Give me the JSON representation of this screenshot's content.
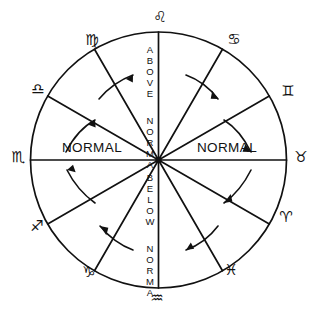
{
  "diagram": {
    "type": "radial-wheel",
    "sector_count": 12,
    "stroke_color": "#111111",
    "background_color": "#ffffff"
  },
  "axis_labels": {
    "top_vertical": "ABOVE NORMAL",
    "bottom_vertical": "BELOW NORMAL",
    "left_horizontal": "NORMAL",
    "right_horizontal": "NORMAL",
    "top_line1": "ABOVE",
    "top_line2": "NORMAL",
    "bottom_line1": "BELOW",
    "bottom_line2": "NORMAL"
  },
  "zodiac_signs": [
    {
      "name": "Leo",
      "glyph": "♌",
      "position": "top",
      "angle_deg": 90
    },
    {
      "name": "Cancer",
      "glyph": "♋",
      "position": "upper-right",
      "angle_deg": 60
    },
    {
      "name": "Gemini",
      "glyph": "♊",
      "position": "right-upper",
      "angle_deg": 30
    },
    {
      "name": "Taurus",
      "glyph": "♉",
      "position": "right",
      "angle_deg": 0
    },
    {
      "name": "Aries",
      "glyph": "♈",
      "position": "right-lower",
      "angle_deg": -30
    },
    {
      "name": "Pisces",
      "glyph": "♓",
      "position": "lower-right",
      "angle_deg": -60
    },
    {
      "name": "Aquarius",
      "glyph": "♒",
      "position": "bottom",
      "angle_deg": -90
    },
    {
      "name": "Capricorn",
      "glyph": "♑",
      "position": "lower-left",
      "angle_deg": -120
    },
    {
      "name": "Sagittarius",
      "glyph": "♐",
      "position": "left-lower",
      "angle_deg": -150
    },
    {
      "name": "Scorpio",
      "glyph": "♏",
      "position": "left",
      "angle_deg": 180
    },
    {
      "name": "Libra",
      "glyph": "♎",
      "position": "left-upper",
      "angle_deg": 150
    },
    {
      "name": "Virgo",
      "glyph": "♍",
      "position": "upper-left",
      "angle_deg": 120
    }
  ],
  "arrows": [
    {
      "id": "arrow-upper-left-outer",
      "quadrant": "upper-left",
      "direction": "clockwise-toward-top"
    },
    {
      "id": "arrow-upper-left-inner",
      "quadrant": "upper-left",
      "direction": "clockwise-toward-top"
    },
    {
      "id": "arrow-upper-right-outer",
      "quadrant": "upper-right",
      "direction": "clockwise-away-from-top"
    },
    {
      "id": "arrow-upper-right-inner",
      "quadrant": "upper-right",
      "direction": "clockwise-away-from-top"
    },
    {
      "id": "arrow-lower-left-outer",
      "quadrant": "lower-left",
      "direction": "counterclockwise-toward-left"
    },
    {
      "id": "arrow-lower-left-inner",
      "quadrant": "lower-left",
      "direction": "counterclockwise-toward-left"
    },
    {
      "id": "arrow-lower-right-outer",
      "quadrant": "lower-right",
      "direction": "counterclockwise-toward-bottom"
    },
    {
      "id": "arrow-lower-right-inner",
      "quadrant": "lower-right",
      "direction": "counterclockwise-toward-bottom"
    }
  ]
}
